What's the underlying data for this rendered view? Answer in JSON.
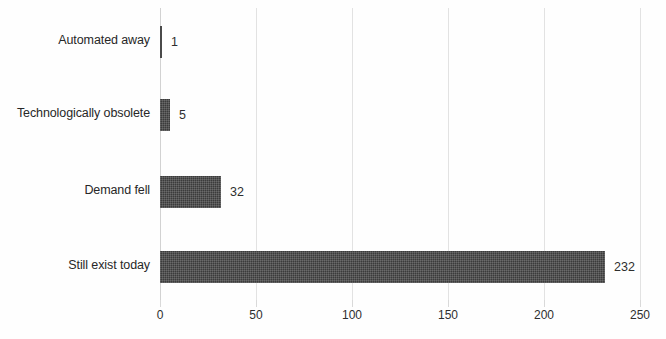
{
  "chart_data": {
    "type": "bar",
    "orientation": "horizontal",
    "title": "",
    "subtitle": "",
    "xlabel": "",
    "ylabel": "",
    "categories": [
      "Automated away",
      "Technologically obsolete",
      "Demand fell",
      "Still exist today"
    ],
    "values": [
      1,
      5,
      32,
      232
    ],
    "value_labels": [
      "1",
      "5",
      "32",
      "232"
    ],
    "xlim": [
      0,
      250
    ],
    "xticks": [
      0,
      50,
      100,
      150,
      200,
      250
    ],
    "xtick_labels": [
      "0",
      "50",
      "100",
      "150",
      "200",
      "250"
    ],
    "grid": true,
    "grid_axis": "x",
    "legend": false,
    "bar_color": "#3b3b3b",
    "grid_color": "#e2e2e2",
    "background_color": "#fefefe",
    "text_color": "#272727"
  }
}
